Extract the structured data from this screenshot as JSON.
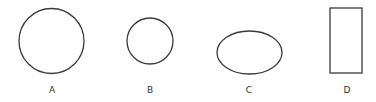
{
  "figures": [
    {
      "id": "A",
      "label": "A",
      "shape": "circle",
      "cx": 51.5,
      "cy": 41,
      "r": 32.5
    },
    {
      "id": "B",
      "label": "B",
      "shape": "circle",
      "cx": 150,
      "cy": 41,
      "r": 23
    },
    {
      "id": "C",
      "label": "C",
      "shape": "ellipse",
      "cx": 249.5,
      "cy": 52.5,
      "rx": 32.5,
      "ry": 21.5
    },
    {
      "id": "D",
      "label": "D",
      "shape": "rectangle",
      "x": 330,
      "y": 8,
      "width": 32,
      "height": 65
    }
  ],
  "colors": {
    "stroke": "#3a3a3a",
    "text": "#333333",
    "background": "#ffffff"
  }
}
